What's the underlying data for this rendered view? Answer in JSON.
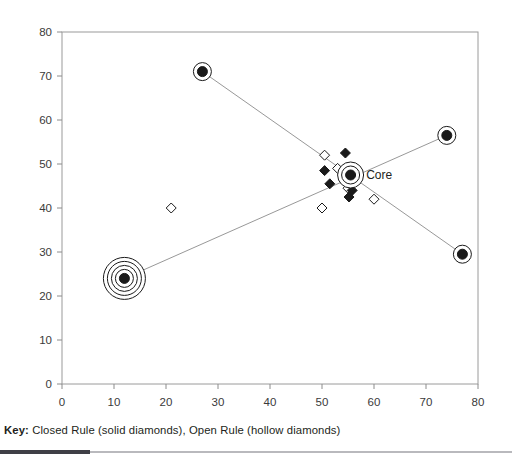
{
  "chart_data": {
    "type": "scatter",
    "title": "",
    "xlabel": "",
    "ylabel": "",
    "xlim": [
      0,
      80
    ],
    "ylim": [
      0,
      80
    ],
    "xticks": [
      0,
      10,
      20,
      30,
      40,
      50,
      60,
      70,
      80
    ],
    "yticks": [
      0,
      10,
      20,
      30,
      40,
      50,
      60,
      70,
      80
    ],
    "grid": false,
    "legend_position": "below-plot",
    "annotations": [
      {
        "text": "Core",
        "x": 58.5,
        "y": 47.5
      }
    ],
    "series": [
      {
        "name": "Ringed Nodes",
        "marker": "filled-circle-with-rings",
        "points": [
          {
            "x": 27,
            "y": 71,
            "rings": 1
          },
          {
            "x": 77,
            "y": 29.5,
            "rings": 1
          },
          {
            "x": 12,
            "y": 24,
            "rings": 4
          },
          {
            "x": 74,
            "y": 56.5,
            "rings": 1
          },
          {
            "x": 55.5,
            "y": 47.5,
            "rings": 2,
            "label": "Core"
          }
        ]
      },
      {
        "name": "Closed Rule (solid diamonds)",
        "marker": "solid-diamond",
        "points": [
          {
            "x": 54.5,
            "y": 52.5
          },
          {
            "x": 50.5,
            "y": 48.5
          },
          {
            "x": 51.5,
            "y": 45.5
          },
          {
            "x": 55.0,
            "y": 47.0
          },
          {
            "x": 56.0,
            "y": 46.5
          },
          {
            "x": 55.8,
            "y": 44.0
          },
          {
            "x": 55.2,
            "y": 42.5
          }
        ]
      },
      {
        "name": "Open Rule (hollow diamonds)",
        "marker": "hollow-diamond",
        "points": [
          {
            "x": 50.5,
            "y": 52.0
          },
          {
            "x": 53.0,
            "y": 49.0
          },
          {
            "x": 55.0,
            "y": 44.5
          },
          {
            "x": 21.0,
            "y": 40.0
          },
          {
            "x": 50.0,
            "y": 40.0
          },
          {
            "x": 60.0,
            "y": 42.0
          }
        ]
      }
    ],
    "connector_lines": [
      {
        "from": {
          "x": 27,
          "y": 71
        },
        "to": {
          "x": 77,
          "y": 29.5
        }
      },
      {
        "from": {
          "x": 12,
          "y": 24
        },
        "to": {
          "x": 74,
          "y": 56.5
        }
      }
    ]
  },
  "caption": {
    "key_label": "Key:",
    "key_text": " Closed Rule (solid diamonds), Open Rule (hollow diamonds)"
  },
  "colors": {
    "axis": "#8c8c8c",
    "marker": "#1a1a1a",
    "line": "#8c8c8c",
    "text": "#231f20",
    "footer_dark": "#3f3f46",
    "footer_light": "#b9b9bd"
  }
}
